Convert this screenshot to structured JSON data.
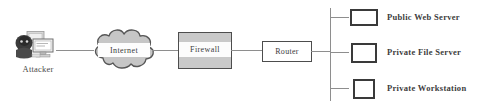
{
  "diagram": {
    "colors": {
      "line": "#8e8e8e",
      "border": "#4d4d4d",
      "node_border": "#3a3a3a",
      "cloud_fill": "#c9c9c9",
      "firewall_fill": "#c9c9c9",
      "band_fill": "#fcfcfc",
      "text": "#3b3b3b",
      "background": "#ffffff"
    },
    "attacker": {
      "label": "Attacker",
      "icon": "attacker-hacker-computer-icon"
    },
    "internet": {
      "label": "Internet",
      "icon": "cloud-icon"
    },
    "firewall": {
      "label": "Firewall",
      "icon": "firewall-box-icon"
    },
    "router": {
      "label": "Router",
      "icon": "router-box-icon"
    },
    "nodes": [
      {
        "label": "Public Web Server",
        "icon": "server-rect-icon"
      },
      {
        "label": "Private File Server",
        "icon": "server-rect-icon"
      },
      {
        "label": "Private Workstation",
        "icon": "workstation-square-icon"
      }
    ]
  }
}
